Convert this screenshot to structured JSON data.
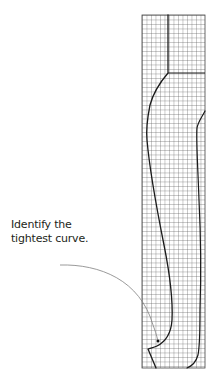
{
  "caption": {
    "line1": "Identify the",
    "line2": "tightest curve."
  },
  "grid": {
    "x": 142,
    "y": 15,
    "width": 63,
    "height": 353,
    "cell_size": 4.5,
    "line_color": "#555555",
    "border_color": "#444444"
  },
  "curves": {
    "stroke_color": "#1a1a1a",
    "pointer_color": "#808080",
    "pointer_dot_color": "#111111"
  }
}
